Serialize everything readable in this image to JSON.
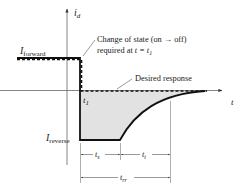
{
  "diagram": {
    "type": "diode reverse recovery time waveform",
    "axes": {
      "y_label": "i",
      "y_label_sub": "d",
      "x_label": "t"
    },
    "levels": {
      "forward_label": "I",
      "forward_sub": "forward",
      "reverse_label": "I",
      "reverse_sub": "reverse"
    },
    "annotations": {
      "state_change_line1": "Change of state (on → off)",
      "state_change_line2_prefix": "required at ",
      "state_change_line2_var": "t = t",
      "state_change_line2_sub": "1",
      "desired_response": "Desired response",
      "t1_label": "t",
      "t1_sub": "1"
    },
    "dimensions": {
      "ts_label": "t",
      "ts_sub": "s",
      "tt_label": "t",
      "tt_sub": "t",
      "trr_label": "t",
      "trr_sub": "rr"
    },
    "colors": {
      "waveform": "#111111",
      "axis": "#555555",
      "fill": "#e2e2e2",
      "dimension": "#555555"
    }
  }
}
